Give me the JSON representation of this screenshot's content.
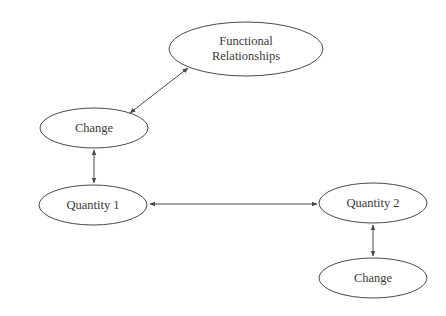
{
  "diagram": {
    "type": "concept-map",
    "colors": {
      "stroke": "#4a4a4a",
      "text": "#3a3a3a",
      "background": "#ffffff"
    },
    "nodes": [
      {
        "id": "functional",
        "label_lines": [
          "Functional",
          "Relationships"
        ],
        "cx": 246,
        "cy": 49,
        "rx": 77,
        "ry": 27
      },
      {
        "id": "change1",
        "label": "Change",
        "cx": 94,
        "cy": 128,
        "rx": 54,
        "ry": 20
      },
      {
        "id": "quantity1",
        "label": "Quantity 1",
        "cx": 93,
        "cy": 205,
        "rx": 54,
        "ry": 20
      },
      {
        "id": "quantity2",
        "label": "Quantity 2",
        "cx": 373,
        "cy": 203,
        "rx": 54,
        "ry": 20
      },
      {
        "id": "change2",
        "label": "Change",
        "cx": 373,
        "cy": 278,
        "rx": 54,
        "ry": 20
      }
    ],
    "edges": [
      {
        "from": "change1",
        "to": "functional",
        "direction": "both"
      },
      {
        "from": "change1",
        "to": "quantity1",
        "direction": "both"
      },
      {
        "from": "quantity1",
        "to": "quantity2",
        "direction": "both"
      },
      {
        "from": "quantity2",
        "to": "change2",
        "direction": "both"
      }
    ]
  },
  "labels": {
    "functional_line1": "Functional",
    "functional_line2": "Relationships",
    "change1": "Change",
    "quantity1": "Quantity 1",
    "quantity2": "Quantity 2",
    "change2": "Change"
  }
}
